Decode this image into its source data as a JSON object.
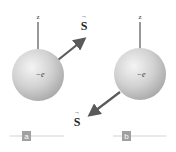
{
  "figure": {
    "panels": [
      {
        "id": "a",
        "panel_label": "a",
        "axis_label": "z",
        "charge_label": "−e",
        "spin_label": "S",
        "spin_direction": "up-right",
        "sphere_color": "#c8c8c8",
        "arrow_color": "#5a5a5a"
      },
      {
        "id": "b",
        "panel_label": "b",
        "axis_label": "z",
        "charge_label": "−e",
        "spin_label": "S",
        "spin_direction": "down-left",
        "sphere_color": "#c8c8c8",
        "arrow_color": "#5a5a5a"
      }
    ],
    "vector_accent": "→",
    "tag_color": "#a0a0a0",
    "rule_color": "#c8c8c8"
  }
}
